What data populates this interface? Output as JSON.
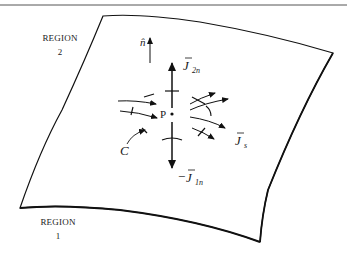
{
  "figure": {
    "regions": {
      "upper": {
        "name": "REGION",
        "number": "2"
      },
      "lower": {
        "name": "REGION",
        "number": "1"
      }
    },
    "labels": {
      "normal": "n̂",
      "point": "P",
      "contour": "C",
      "j2n_main": "J",
      "j2n_sub": "2n",
      "j1n_prefix": "−",
      "j1n_main": "J",
      "j1n_sub": "1n",
      "js_main": "J",
      "js_sub": "s"
    },
    "colors": {
      "ink": "#111111",
      "background": "#ffffff",
      "rule": "#555555"
    }
  }
}
